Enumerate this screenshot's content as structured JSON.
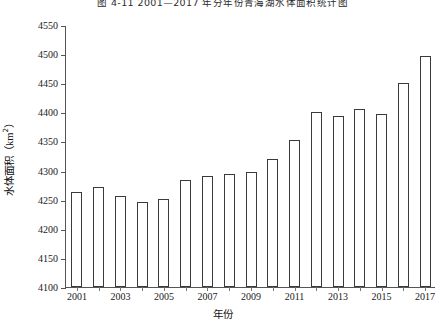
{
  "figure": {
    "title": "图 4-11  2001—2017 年分年份青海湖水体面积统计图",
    "x_axis_title": "年份",
    "y_axis_title_text": "水体面积",
    "y_axis_unit": "（km",
    "y_axis_unit_sup": "2",
    "y_axis_unit_close": "）",
    "frame_color": "#555555",
    "bar_edge_color": "#3a3a3a",
    "bar_fill_color": "#ffffff"
  },
  "chart_data": {
    "type": "bar",
    "title": "图 4-11  2001—2017 年分年份青海湖水体面积统计图",
    "xlabel": "年份",
    "ylabel": "水体面积（km²）",
    "categories": [
      "2001",
      "2002",
      "2003",
      "2004",
      "2005",
      "2006",
      "2007",
      "2008",
      "2009",
      "2010",
      "2011",
      "2012",
      "2013",
      "2014",
      "2015",
      "2016",
      "2017"
    ],
    "values": [
      4263,
      4272,
      4256,
      4246,
      4252,
      4284,
      4290,
      4294,
      4298,
      4320,
      4353,
      4401,
      4394,
      4406,
      4397,
      4450,
      4496
    ],
    "x_tick_labels": [
      "2001",
      "2003",
      "2005",
      "2007",
      "2009",
      "2011",
      "2013",
      "2015",
      "2017"
    ],
    "y_tick_labels": [
      "4100",
      "4150",
      "4200",
      "4250",
      "4300",
      "4350",
      "4400",
      "4450",
      "4500",
      "4550"
    ],
    "y_ticks": [
      4100,
      4150,
      4200,
      4250,
      4300,
      4350,
      4400,
      4450,
      4500,
      4550
    ],
    "ylim": [
      4100,
      4550
    ],
    "grid": false,
    "legend": null,
    "series": [
      {
        "name": "水体面积",
        "values": [
          4263,
          4272,
          4256,
          4246,
          4252,
          4284,
          4290,
          4294,
          4298,
          4320,
          4353,
          4401,
          4394,
          4406,
          4397,
          4450,
          4496
        ]
      }
    ]
  }
}
